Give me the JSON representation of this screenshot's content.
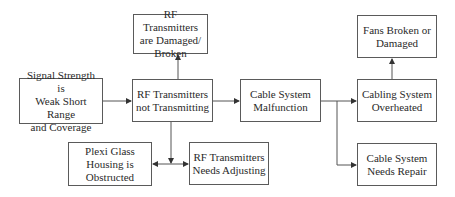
{
  "diagram": {
    "type": "flowchart",
    "nodes": [
      {
        "id": "signal_weak",
        "label": "Signal Strength is\nWeak Short Range\nand Coverage"
      },
      {
        "id": "rf_not_transmitting",
        "label": "RF Transmitters\nnot Transmitting"
      },
      {
        "id": "rf_damaged",
        "label": "RF Transmitters\nare Damaged/\nBroken"
      },
      {
        "id": "plexi_obstructed",
        "label": "Plexi Glass\nHousing is\nObstructed"
      },
      {
        "id": "rf_adjusting",
        "label": "RF Transmitters\nNeeds Adjusting"
      },
      {
        "id": "cable_malfunction",
        "label": "Cable System\nMalfunction"
      },
      {
        "id": "cabling_overheated",
        "label": "Cabling System\nOverheated"
      },
      {
        "id": "fans_broken",
        "label": "Fans Broken or\nDamaged"
      },
      {
        "id": "cable_repair",
        "label": "Cable System\nNeeds Repair"
      }
    ],
    "edges": [
      {
        "from": "signal_weak",
        "to": "rf_not_transmitting"
      },
      {
        "from": "rf_not_transmitting",
        "to": "rf_damaged"
      },
      {
        "from": "rf_not_transmitting",
        "to": "plexi_obstructed"
      },
      {
        "from": "rf_not_transmitting",
        "to": "rf_adjusting"
      },
      {
        "from": "rf_not_transmitting",
        "to": "cable_malfunction"
      },
      {
        "from": "cable_malfunction",
        "to": "cabling_overheated"
      },
      {
        "from": "cable_malfunction",
        "to": "cable_repair"
      },
      {
        "from": "cabling_overheated",
        "to": "fans_broken"
      }
    ],
    "colors": {
      "line": "#555555",
      "text": "#2a2a2a",
      "background": "#ffffff"
    }
  }
}
